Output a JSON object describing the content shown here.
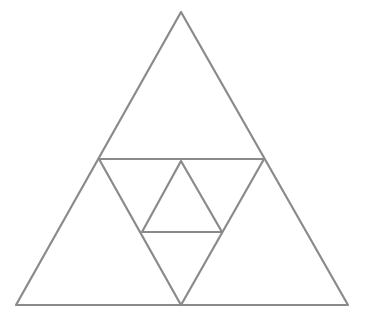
{
  "figure": {
    "width": 365,
    "height": 314,
    "background": "#ffffff",
    "stroke_color": "#8a8a8a",
    "stroke_width": 2.2
  },
  "shapes": {
    "outer_triangle": {
      "points": [
        [
          181,
          12
        ],
        [
          16,
          305
        ],
        [
          348,
          305
        ]
      ]
    },
    "midline_horizontal": {
      "from": [
        99,
        159
      ],
      "to": [
        264,
        159
      ]
    },
    "middle_triangle": {
      "points": [
        [
          99,
          159
        ],
        [
          264,
          159
        ],
        [
          181,
          305
        ]
      ]
    },
    "inner_triangle": {
      "points": [
        [
          181,
          161
        ],
        [
          142,
          232
        ],
        [
          222,
          232
        ]
      ]
    }
  }
}
